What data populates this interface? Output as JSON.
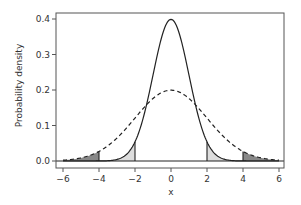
{
  "chart_data": {
    "type": "line",
    "title": "",
    "xlabel": "x",
    "ylabel": "Probability density",
    "xlim": [
      -6.3,
      6.3
    ],
    "ylim": [
      -0.02,
      0.42
    ],
    "xticks": [
      -6,
      -4,
      -2,
      0,
      2,
      4,
      6
    ],
    "xtick_labels": [
      "−6",
      "−4",
      "−2",
      "0",
      "2",
      "4",
      "6"
    ],
    "yticks": [
      0.0,
      0.1,
      0.2,
      0.3,
      0.4
    ],
    "ytick_labels": [
      "0.0",
      "0.1",
      "0.2",
      "0.3",
      "0.4"
    ],
    "grid": false,
    "legend": null,
    "series": [
      {
        "name": "Normal(mean=0, sd=1)",
        "style": "solid",
        "color": "#222222",
        "mean": 0,
        "sd": 1,
        "peak": 0.399,
        "shaded_tails": {
          "lower": -2,
          "upper": 2,
          "fill": "#dddddd"
        }
      },
      {
        "name": "Normal(mean=0, sd=2)",
        "style": "dashed",
        "color": "#222222",
        "mean": 0,
        "sd": 2,
        "peak": 0.199,
        "shaded_tails": {
          "lower": -4,
          "upper": 4,
          "fill": "#888888"
        }
      }
    ],
    "baseline": 0.0
  },
  "colors": {
    "frame": "#555555",
    "curve": "#222222",
    "light_fill": "#dddddd",
    "dark_fill": "#888888",
    "text": "#333333"
  }
}
